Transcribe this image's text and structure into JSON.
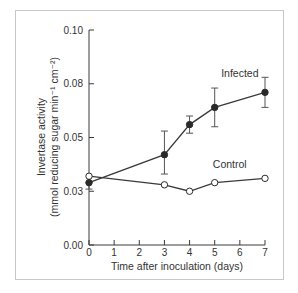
{
  "chart_data": {
    "type": "line",
    "title": "",
    "xlabel": "Time after inoculation (days)",
    "ylabel_line1": "Invertase activity",
    "ylabel_line2": "(mmol reducing sugar min⁻¹ cm⁻²)",
    "xlim": [
      0,
      7
    ],
    "ylim": [
      0,
      0.1
    ],
    "x_ticks": [
      0,
      1,
      2,
      3,
      4,
      5,
      6,
      7
    ],
    "x_tick_labels": [
      "0",
      "1",
      "2",
      "3",
      "4",
      "5",
      "6",
      "7"
    ],
    "y_ticks": [
      0,
      0.025,
      0.05,
      0.075,
      0.1
    ],
    "y_tick_labels": [
      "0.00",
      "0.03",
      "0.05",
      "0.08",
      "0.10"
    ],
    "grid": false,
    "legend": "inline labels",
    "series": [
      {
        "name": "Infected",
        "marker": "filled-circle",
        "x": [
          0,
          3,
          4,
          5,
          7
        ],
        "values": [
          0.029,
          0.042,
          0.056,
          0.064,
          0.071
        ],
        "error_low": [
          0.026,
          0.033,
          0.052,
          0.055,
          0.064
        ],
        "error_high": [
          0.029,
          0.053,
          0.06,
          0.073,
          0.078
        ],
        "label_pos": {
          "x": 6.0,
          "y": 0.078
        }
      },
      {
        "name": "Control",
        "marker": "open-circle",
        "x": [
          0,
          3,
          4,
          5,
          7
        ],
        "values": [
          0.032,
          0.028,
          0.025,
          0.029,
          0.031
        ],
        "label_pos": {
          "x": 5.6,
          "y": 0.036
        }
      }
    ]
  }
}
